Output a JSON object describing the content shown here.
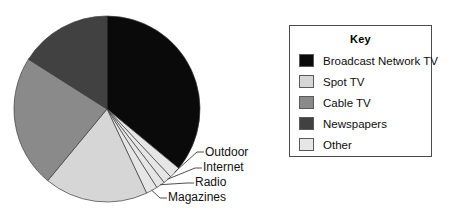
{
  "legend": {
    "title": "Key",
    "items": [
      {
        "label": "Broadcast Network TV",
        "color": "#0a0a0a"
      },
      {
        "label": "Spot TV",
        "color": "#d6d6d6"
      },
      {
        "label": "Cable TV",
        "color": "#8a8a8a"
      },
      {
        "label": "Newspapers",
        "color": "#414141"
      },
      {
        "label": "Other",
        "color": "#e6e6e6"
      }
    ]
  },
  "callouts": [
    {
      "label": "Outdoor",
      "x": 205,
      "y": 152
    },
    {
      "label": "Internet",
      "x": 203,
      "y": 168
    },
    {
      "label": "Radio",
      "x": 195,
      "y": 183
    },
    {
      "label": "Magazines",
      "x": 168,
      "y": 198
    }
  ],
  "chart_data": {
    "type": "pie",
    "title": "",
    "legend_title": "Key",
    "legend_position": "right",
    "grid": false,
    "start_angle_deg": 0,
    "direction": "clockwise",
    "center": {
      "x": 107,
      "y": 109
    },
    "radius": 93,
    "categories": [
      "Broadcast Network TV",
      "Outdoor",
      "Internet",
      "Radio",
      "Magazines",
      "Spot TV",
      "Cable TV",
      "Newspapers"
    ],
    "values": [
      36,
      2,
      1.5,
      1.5,
      2,
      18,
      23,
      16
    ],
    "unit": "percent",
    "colors": [
      "#0a0a0a",
      "#e6e6e6",
      "#e6e6e6",
      "#e6e6e6",
      "#e6e6e6",
      "#d6d6d6",
      "#8a8a8a",
      "#414141"
    ],
    "slices": [
      {
        "label": "Broadcast Network TV",
        "value": 36,
        "color": "#0a0a0a",
        "start_deg": 0,
        "end_deg": 129.6,
        "labeled_in": "legend"
      },
      {
        "label": "Outdoor",
        "value": 2,
        "color": "#e6e6e6",
        "start_deg": 129.6,
        "end_deg": 136.8,
        "labeled_in": "callout"
      },
      {
        "label": "Internet",
        "value": 1.5,
        "color": "#e6e6e6",
        "start_deg": 136.8,
        "end_deg": 142.2,
        "labeled_in": "callout"
      },
      {
        "label": "Radio",
        "value": 1.5,
        "color": "#e6e6e6",
        "start_deg": 142.2,
        "end_deg": 147.6,
        "labeled_in": "callout"
      },
      {
        "label": "Magazines",
        "value": 2,
        "color": "#e6e6e6",
        "start_deg": 147.6,
        "end_deg": 154.8,
        "labeled_in": "callout"
      },
      {
        "label": "Spot TV",
        "value": 18,
        "color": "#d6d6d6",
        "start_deg": 154.8,
        "end_deg": 219.6,
        "labeled_in": "legend"
      },
      {
        "label": "Cable TV",
        "value": 23,
        "color": "#8a8a8a",
        "start_deg": 219.6,
        "end_deg": 302.4,
        "labeled_in": "legend"
      },
      {
        "label": "Newspapers",
        "value": 16,
        "color": "#414141",
        "start_deg": 302.4,
        "end_deg": 360,
        "labeled_in": "legend"
      }
    ]
  }
}
